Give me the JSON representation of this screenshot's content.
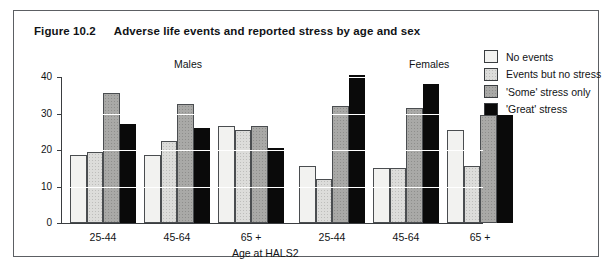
{
  "figure": {
    "number": "Figure 10.2",
    "title": "Adverse life events and reported stress by age and sex"
  },
  "legend": {
    "items": [
      {
        "label": "No events",
        "swatch": "fill-0",
        "color": "#f2f2f0"
      },
      {
        "label": "Events but no stress",
        "swatch": "fill-1",
        "color": "#dcdcda"
      },
      {
        "label": "'Some' stress only",
        "swatch": "fill-2",
        "color": "#a9a9a7"
      },
      {
        "label": "'Great' stress",
        "swatch": "fill-3",
        "color": "#0a0a0a"
      }
    ]
  },
  "headings": {
    "males": "Males",
    "females": "Females"
  },
  "chart_data": {
    "type": "bar",
    "title": "Adverse life events and reported stress by age and sex",
    "xlabel": "Age at HALS2",
    "ylabel": "",
    "ylim": [
      0,
      40
    ],
    "yticks": [
      0,
      10,
      20,
      30,
      40
    ],
    "ytick_labels": [
      "0",
      "10",
      "20",
      "30",
      "40"
    ],
    "grid": true,
    "legend_position": "top-right outside",
    "group_labels": [
      "Males",
      "Females"
    ],
    "categories": [
      "25-44",
      "45-64",
      "65 +",
      "25-44",
      "45-64",
      "65 +"
    ],
    "series": [
      {
        "name": "No events",
        "values": [
          18.5,
          18.5,
          26.5,
          15.5,
          15.0,
          25.5
        ]
      },
      {
        "name": "Events but no stress",
        "values": [
          19.5,
          22.5,
          25.5,
          12.0,
          15.0,
          15.5
        ]
      },
      {
        "name": "'Some' stress only",
        "values": [
          35.5,
          32.5,
          26.5,
          32.0,
          31.5,
          29.5
        ]
      },
      {
        "name": "'Great' stress",
        "values": [
          27.0,
          26.0,
          20.5,
          40.5,
          38.0,
          29.5
        ]
      }
    ]
  }
}
